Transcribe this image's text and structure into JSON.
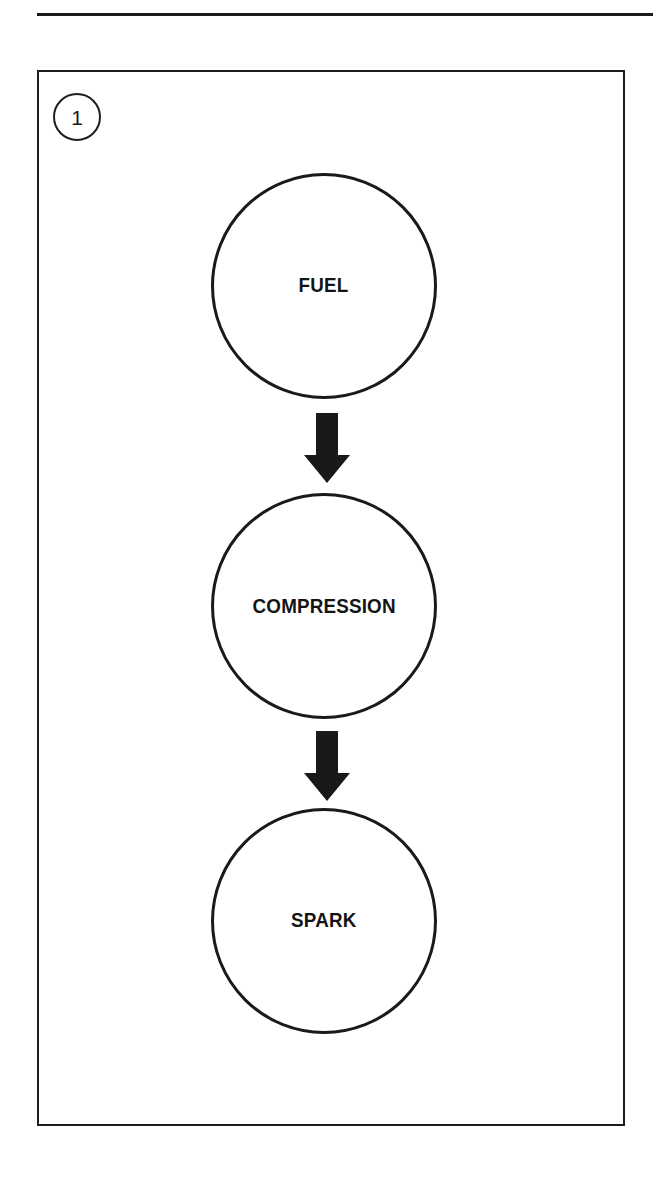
{
  "page": {
    "background_color": "#ffffff",
    "ink_color": "#1a1a1a",
    "width": 653,
    "height": 1181
  },
  "top_rule": {
    "name": "horizontal-divider",
    "color": "#1a1a1a"
  },
  "figure": {
    "number": "1",
    "frame_color": "#1d1d1d",
    "background_color": "#ffffff",
    "type": "flowchart",
    "orientation": "vertical"
  },
  "diagram_data": {
    "type": "flowchart",
    "shape": "circle",
    "direction": "top-to-bottom",
    "nodes": [
      {
        "id": "fuel",
        "label": "FUEL",
        "order": 1
      },
      {
        "id": "compression",
        "label": "COMPRESSION",
        "order": 2
      },
      {
        "id": "spark",
        "label": "SPARK",
        "order": 3
      }
    ],
    "edges": [
      {
        "from": "fuel",
        "to": "compression",
        "style": "block-arrow",
        "direction": "down"
      },
      {
        "from": "compression",
        "to": "spark",
        "style": "block-arrow",
        "direction": "down"
      }
    ]
  }
}
